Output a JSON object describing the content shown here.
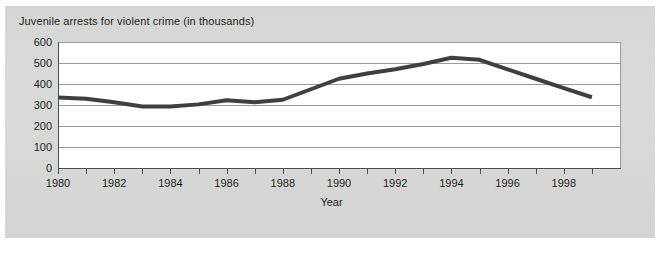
{
  "chart_data": {
    "type": "line",
    "title": "Juvenile arrests for violent crime (in thousands)",
    "xlabel": "Year",
    "ylabel": "",
    "ylim": [
      0,
      600
    ],
    "xlim": [
      1980,
      1999
    ],
    "grid": true,
    "legend": "none",
    "yticks": [
      600,
      500,
      400,
      300,
      200,
      100,
      0
    ],
    "xticks": [
      1980,
      1981,
      1982,
      1983,
      1984,
      1985,
      1986,
      1987,
      1988,
      1989,
      1990,
      1991,
      1992,
      1993,
      1994,
      1995,
      1996,
      1997,
      1998,
      1999
    ],
    "xtick_labels": [
      "1980",
      "",
      "1982",
      "",
      "1984",
      "",
      "1986",
      "",
      "1988",
      "",
      "1990",
      "",
      "1992",
      "",
      "1994",
      "",
      "1996",
      "",
      "1998",
      ""
    ],
    "series": [
      {
        "name": "Juvenile arrests for violent crime",
        "color": "#3f3f3f",
        "x": [
          1980,
          1981,
          1982,
          1983,
          1984,
          1985,
          1986,
          1987,
          1988,
          1989,
          1990,
          1991,
          1992,
          1993,
          1994,
          1995,
          1996,
          1997,
          1998,
          1999
        ],
        "values": [
          336,
          330,
          313,
          293,
          293,
          303,
          323,
          313,
          325,
          375,
          425,
          450,
          470,
          495,
          525,
          515,
          470,
          425,
          380,
          337
        ]
      }
    ]
  },
  "figure": {
    "background_color": "#ffffff",
    "panel_color": "#d8d8d8",
    "plot_background": "#ffffff",
    "gridline_color": "#9a9a9a",
    "axis_color": "#4d4d4d",
    "text_color": "#231f20"
  }
}
